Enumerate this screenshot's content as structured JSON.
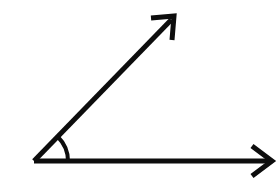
{
  "figure": {
    "background_color": "#ffffff",
    "stroke_color": "#0d0d0d",
    "width": 278,
    "height": 194
  },
  "geometry": {
    "vertex": {
      "x": 34,
      "y": 161
    },
    "horizontal_ray": {
      "name": "horizontal-ray",
      "from": {
        "x": 34,
        "y": 161
      },
      "to": {
        "x": 271,
        "y": 161
      },
      "thickness": 5,
      "direction": "right",
      "arrow": {
        "name": "horizontal-arrowhead",
        "tip": {
          "x": 272,
          "y": 161
        },
        "upper_wing_end": {
          "x": 252,
          "y": 146
        },
        "lower_wing_end": {
          "x": 252,
          "y": 176
        },
        "thickness": 5,
        "style": "open-chevron"
      }
    },
    "diagonal_ray": {
      "name": "diagonal-ray",
      "from": {
        "x": 34,
        "y": 161
      },
      "to": {
        "x": 172,
        "y": 19
      },
      "thickness": 5,
      "direction": "up-right",
      "angle_degrees": 45.8,
      "arrow": {
        "name": "diagonal-arrowhead",
        "tip": {
          "x": 174,
          "y": 16
        },
        "left_wing_end": {
          "x": 151,
          "y": 18
        },
        "right_wing_end": {
          "x": 172,
          "y": 40
        },
        "thickness": 5,
        "style": "open-chevron"
      }
    },
    "angle_arc": {
      "name": "angle-arc",
      "center": {
        "x": 34,
        "y": 161
      },
      "radius": 34,
      "start_point": {
        "x": 58,
        "y": 137
      },
      "end_point": {
        "x": 68,
        "y": 161
      },
      "sweep_degrees": 46,
      "thickness": 4
    }
  },
  "chart_data": {
    "type": "diagram",
    "elements": [
      {
        "label": "vertex",
        "x": 34,
        "y": 161
      },
      {
        "label": "horizontal ray endpoint",
        "x": 272,
        "y": 161
      },
      {
        "label": "diagonal ray endpoint",
        "x": 174,
        "y": 16
      },
      {
        "label": "angle arc radius",
        "value": 34
      }
    ],
    "measured_angle_degrees": 46
  }
}
